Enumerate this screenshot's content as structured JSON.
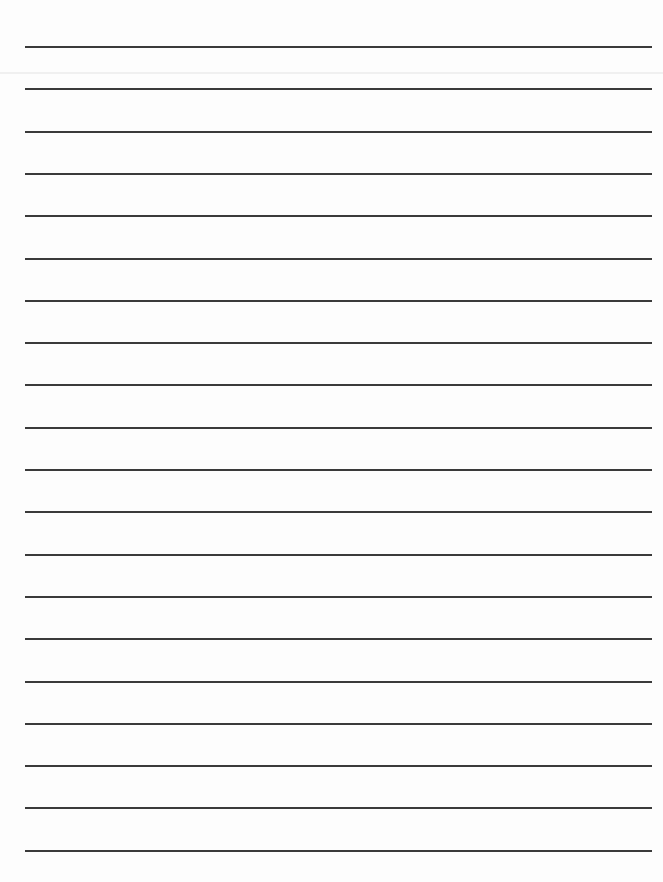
{
  "page": {
    "type": "lined-paper",
    "background": "#fdfdfd",
    "line_color": "#3a3a3a",
    "line_count": 20,
    "first_line_y": 46,
    "line_spacing": 42.3,
    "line_left": 25,
    "line_width": 627
  }
}
